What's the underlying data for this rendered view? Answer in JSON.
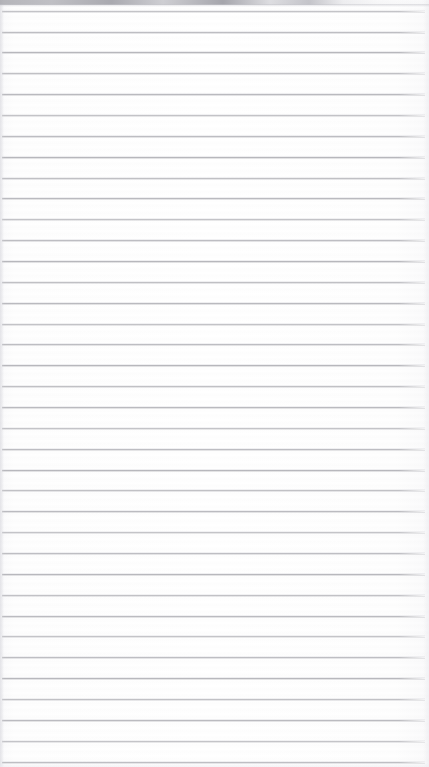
{
  "image": {
    "subject": "blank lined notebook paper",
    "content_text": "",
    "width_px": 429,
    "height_px": 767
  },
  "paper": {
    "background_color": "#fdfdfd",
    "rule_line_color": "#b6b6bb",
    "rule_line_thickness_px": 1,
    "rule_line_spacing_px": 20.8,
    "rule_line_left_px": 2,
    "rule_line_right_px": 425,
    "rule_line_count": 37
  },
  "artifacts": {
    "top_strip_color": "#a8a8ae",
    "top_strip_height_px": 5,
    "left_band_color": "#dedee3",
    "right_band_color": "#eaeaee",
    "bottom_band_color": "#eeeef2"
  },
  "rule_lines": [
    {
      "y": 11
    },
    {
      "y": 32
    },
    {
      "y": 52
    },
    {
      "y": 73
    },
    {
      "y": 94
    },
    {
      "y": 115
    },
    {
      "y": 136
    },
    {
      "y": 157
    },
    {
      "y": 178
    },
    {
      "y": 198
    },
    {
      "y": 219
    },
    {
      "y": 240
    },
    {
      "y": 261
    },
    {
      "y": 282
    },
    {
      "y": 303
    },
    {
      "y": 324
    },
    {
      "y": 344
    },
    {
      "y": 365
    },
    {
      "y": 386
    },
    {
      "y": 407
    },
    {
      "y": 428
    },
    {
      "y": 449
    },
    {
      "y": 470
    },
    {
      "y": 490
    },
    {
      "y": 511
    },
    {
      "y": 532
    },
    {
      "y": 553
    },
    {
      "y": 574
    },
    {
      "y": 595
    },
    {
      "y": 616
    },
    {
      "y": 636
    },
    {
      "y": 657
    },
    {
      "y": 678
    },
    {
      "y": 699
    },
    {
      "y": 720
    },
    {
      "y": 741
    },
    {
      "y": 762
    }
  ]
}
